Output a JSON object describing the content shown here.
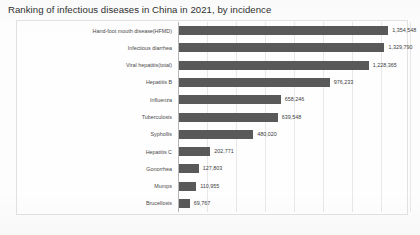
{
  "chart_data": {
    "type": "bar",
    "orientation": "horizontal",
    "title": "Ranking of infectious diseases in China in 2021, by incidence",
    "xlabel": "",
    "ylabel": "",
    "grid": true,
    "legend": false,
    "xlim": [
      0,
      1450000
    ],
    "categories": [
      "Hand-foot mouth disease(HFMD)",
      "Infectious diarrhea",
      "Viral hepatitis(total)",
      "Hepatitis B",
      "Influenza",
      "Tuberculosis",
      "Syphollis",
      "Hepatitis C",
      "Gonorrhea",
      "Mumps",
      "Brucellosis"
    ],
    "values": [
      1354548,
      1329790,
      1228365,
      976233,
      658246,
      639548,
      480020,
      202771,
      127803,
      110955,
      69767
    ],
    "value_labels": [
      "1,354,548",
      "1,329,790",
      "1,228,365",
      "976,233",
      "658,246",
      "639,548",
      "480,020",
      "202,771",
      "127,803",
      "110,955",
      "69,767"
    ],
    "bar_color": "#595959",
    "gridline_color": "#e8e8e8",
    "axis_color": "#b5b5b5"
  }
}
